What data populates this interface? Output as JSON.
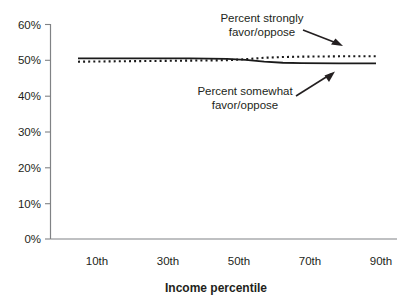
{
  "chart_data": {
    "type": "line",
    "title": "",
    "xlabel": "Income percentile",
    "ylabel": "",
    "ylim": [
      0,
      60
    ],
    "xlim": [
      5,
      95
    ],
    "grid": false,
    "legend_position": "none",
    "y_ticks": [
      "0%",
      "10%",
      "20%",
      "30%",
      "40%",
      "50%",
      "60%"
    ],
    "y_tick_values": [
      0,
      10,
      20,
      30,
      40,
      50,
      60
    ],
    "x_ticks": [
      "10th",
      "30th",
      "50th",
      "70th",
      "90th"
    ],
    "x_tick_values": [
      10,
      30,
      50,
      70,
      90
    ],
    "x": [
      10,
      20,
      30,
      40,
      50,
      55,
      60,
      65,
      70,
      80,
      90
    ],
    "series": [
      {
        "name": "Percent somewhat favor/oppose",
        "style": "solid",
        "values": [
          50.5,
          50.5,
          50.5,
          50.5,
          50.4,
          50.1,
          49.6,
          49.3,
          49.2,
          49.1,
          49.1
        ]
      },
      {
        "name": "Percent strongly favor/oppose",
        "style": "dotted",
        "values": [
          49.6,
          49.7,
          49.8,
          49.9,
          50.0,
          50.3,
          50.7,
          50.9,
          51.0,
          51.1,
          51.1
        ]
      }
    ],
    "annotations": [
      {
        "id": "strongly",
        "line1": "Percent strongly",
        "line2": "favor/oppose",
        "arrow": "down-right"
      },
      {
        "id": "somewhat",
        "line1": "Percent somewhat",
        "line2": "favor/oppose",
        "arrow": "up-right"
      }
    ],
    "colors": {
      "series_line": "#1a1a1a",
      "axis": "#808285",
      "text": "#231f20",
      "background": "#ffffff"
    }
  }
}
